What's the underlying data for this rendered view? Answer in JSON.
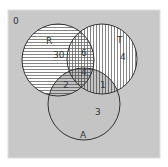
{
  "diagram": {
    "type": "venn",
    "universe": {
      "label": "0",
      "color": "#c8c8c8"
    },
    "sets": [
      {
        "id": "R",
        "label": "R",
        "pattern": "horizontal-stripes",
        "cx": 58,
        "cy": 60,
        "r": 36
      },
      {
        "id": "T",
        "label": "T",
        "pattern": "vertical-stripes",
        "cx": 102,
        "cy": 59,
        "r": 35
      },
      {
        "id": "A",
        "label": "A",
        "pattern": "shaded",
        "cx": 84,
        "cy": 104,
        "r": 36
      }
    ],
    "regions": {
      "R_only": "30",
      "T_only": "4",
      "A_only": "3",
      "R_and_T_only": "6",
      "R_and_A_only": "2",
      "T_and_A_only": "1",
      "R_and_T_and_A": "4"
    },
    "colors": {
      "background": "#ffffff",
      "universe_fill": "#c8c8c8",
      "circle_stroke": "#333333",
      "stripe": "#555555",
      "circle_fill": "#ffffff",
      "a_fill": "#c4c4c4"
    }
  }
}
